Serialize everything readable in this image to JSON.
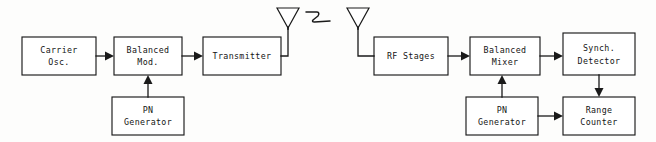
{
  "diagram": {
    "ink_color": "#1a1a1a",
    "paper_color": "#fdfdfc",
    "blocks": [
      {
        "id": "carrier-osc",
        "line1": "Carrier",
        "line2": "Osc.",
        "x": 22,
        "y": 37,
        "w": 74,
        "h": 38
      },
      {
        "id": "balanced-mod",
        "line1": "Balanced",
        "line2": "Mod.",
        "x": 114,
        "y": 37,
        "w": 68,
        "h": 38
      },
      {
        "id": "transmitter",
        "line1": "Transmitter",
        "line2": "",
        "x": 203,
        "y": 37,
        "w": 78,
        "h": 38
      },
      {
        "id": "pn-generator-tx",
        "line1": "PN",
        "line2": "Generator",
        "x": 112,
        "y": 97,
        "w": 72,
        "h": 38
      },
      {
        "id": "rf-stages",
        "line1": "RF Stages",
        "line2": "",
        "x": 374,
        "y": 37,
        "w": 74,
        "h": 38
      },
      {
        "id": "balanced-mixer",
        "line1": "Balanced",
        "line2": "Mixer",
        "x": 470,
        "y": 37,
        "w": 70,
        "h": 38
      },
      {
        "id": "synch-detector",
        "line1": "Synch.",
        "line2": "Detector",
        "x": 563,
        "y": 33,
        "w": 72,
        "h": 42
      },
      {
        "id": "pn-generator-rx",
        "line1": "PN",
        "line2": "Generator",
        "x": 466,
        "y": 97,
        "w": 72,
        "h": 38
      },
      {
        "id": "range-counter",
        "line1": "Range",
        "line2": "Counter",
        "x": 563,
        "y": 97,
        "w": 72,
        "h": 38
      }
    ],
    "antennas": [
      {
        "id": "transmit-antenna",
        "label": "transmit-antenna",
        "apex_x": 288,
        "top_y": 8,
        "half_w": 11,
        "cone_h": 20,
        "mast_bottom": 53
      },
      {
        "id": "receive-antenna",
        "label": "receive-antenna",
        "apex_x": 358,
        "top_y": 8,
        "half_w": 11,
        "cone_h": 20,
        "mast_bottom": 53
      }
    ],
    "wave_symbol": {
      "id": "radio-wave-squiggle",
      "label": "radio wave propagation"
    },
    "connections": [
      {
        "id": "carrier-to-mod",
        "from": "carrier-osc",
        "to": "balanced-mod",
        "direction": "right"
      },
      {
        "id": "mod-to-transmitter",
        "from": "balanced-mod",
        "to": "transmitter",
        "direction": "right"
      },
      {
        "id": "pn-to-mod",
        "from": "pn-generator-tx",
        "to": "balanced-mod",
        "direction": "up"
      },
      {
        "id": "transmitter-to-ant",
        "from": "transmitter",
        "to": "transmit-antenna",
        "direction": "up"
      },
      {
        "id": "ant-to-rf",
        "from": "receive-antenna",
        "to": "rf-stages",
        "direction": "down-right"
      },
      {
        "id": "rf-to-mixer",
        "from": "rf-stages",
        "to": "balanced-mixer",
        "direction": "right"
      },
      {
        "id": "mixer-to-detector",
        "from": "balanced-mixer",
        "to": "synch-detector",
        "direction": "right"
      },
      {
        "id": "pn-to-mixer",
        "from": "pn-generator-rx",
        "to": "balanced-mixer",
        "direction": "up"
      },
      {
        "id": "pn-to-counter",
        "from": "pn-generator-rx",
        "to": "range-counter",
        "direction": "right"
      },
      {
        "id": "detector-to-counter",
        "from": "synch-detector",
        "to": "range-counter",
        "direction": "down"
      }
    ]
  }
}
